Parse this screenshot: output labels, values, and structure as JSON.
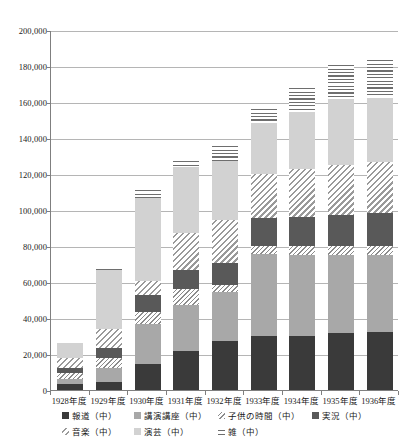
{
  "chart_data": {
    "type": "bar",
    "subtype": "stacked-bar",
    "title": "",
    "xlabel": "",
    "ylabel": "",
    "ylim": [
      0,
      200000
    ],
    "ytick_step": 20000,
    "ytick_labels": [
      "200,000",
      "180,000",
      "160,000",
      "140,000",
      "120,000",
      "100,000",
      "80,000",
      "60,000",
      "40,000",
      "20,000",
      "0"
    ],
    "ytick_values": [
      200000,
      180000,
      160000,
      140000,
      120000,
      100000,
      80000,
      60000,
      40000,
      20000,
      0
    ],
    "grid": true,
    "legend_position": "bottom",
    "categories": [
      "1928年度",
      "1929年度",
      "1930年度",
      "1931年度",
      "1932年度",
      "1933年度",
      "1934年度",
      "1935年度",
      "1936年度"
    ],
    "series": [
      {
        "name": "報道（中）",
        "key": "houdou",
        "pattern": "solid-black",
        "values": [
          3500,
          4200,
          14700,
          21600,
          27200,
          29800,
          29800,
          31500,
          32500
        ]
      },
      {
        "name": "講演講座（中）",
        "key": "kouen",
        "pattern": "solid-mid-gray",
        "values": [
          2600,
          8000,
          21800,
          25800,
          27000,
          45600,
          45300,
          43500,
          42600
        ]
      },
      {
        "name": "子供の時間（中）",
        "key": "kodomo",
        "pattern": "thin-diagonal",
        "values": [
          3200,
          5500,
          7000,
          8600,
          4300,
          4500,
          4700,
          4800,
          4800
        ]
      },
      {
        "name": "実況（中）",
        "key": "jikkyou",
        "pattern": "solid-dark-gray",
        "values": [
          3000,
          5600,
          9300,
          10600,
          12000,
          15400,
          16500,
          17600,
          18300
        ]
      },
      {
        "name": "音楽（中）",
        "key": "ongaku",
        "pattern": "diagonal-hatch",
        "values": [
          5600,
          10800,
          7500,
          20400,
          23800,
          24800,
          26300,
          27700,
          28300
        ]
      },
      {
        "name": "演芸（中）",
        "key": "engei",
        "pattern": "solid-light-gray",
        "values": [
          8400,
          32500,
          46200,
          37000,
          32700,
          28200,
          31800,
          36800,
          36000
        ]
      },
      {
        "name": "雑（中）",
        "key": "zatsu",
        "pattern": "horizontal-lines",
        "values": [
          0,
          1600,
          5700,
          4600,
          9800,
          8900,
          14300,
          20000,
          21700
        ]
      }
    ],
    "totals": [
      26300,
      68200,
      112200,
      128600,
      136800,
      157200,
      168700,
      181900,
      184200
    ]
  },
  "legend": {
    "rows": [
      [
        {
          "label": "報道（中）",
          "key": "houdou"
        },
        {
          "label": "講演講座（中）",
          "key": "kouen"
        },
        {
          "label": "子供の時間（中）",
          "key": "kodomo"
        },
        {
          "label": "実況（中）",
          "key": "jikkyou"
        }
      ],
      [
        {
          "label": "音楽（中）",
          "key": "ongaku"
        },
        {
          "label": "演芸（中）",
          "key": "engei"
        },
        {
          "label": "雑（中）",
          "key": "zatsu"
        }
      ]
    ]
  },
  "colors": {
    "houdou": "#3a3a3a",
    "kouen": "#a8a8a8",
    "kodomo": "#8c8c8c",
    "jikkyou": "#595959",
    "ongaku": "#9a9a9a",
    "engei": "#d2d2d2",
    "zatsu": "#6e6e6e",
    "grid": "#b5b5b5",
    "axis": "#7f7f7f",
    "text": "#1a1a1a"
  }
}
